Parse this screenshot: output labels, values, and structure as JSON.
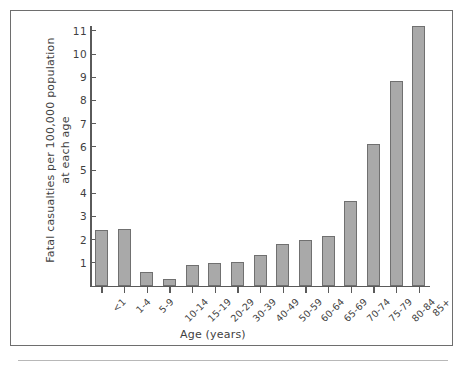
{
  "chart_data": {
    "type": "bar",
    "title": "",
    "subtitle": "",
    "xlabel": "Age (years)",
    "ylabel_line1": "Fatal casualties per 100,000 population",
    "ylabel_line2": "at each age",
    "categories": [
      "<1",
      "1-4",
      "5-9",
      "10-14",
      "15-19",
      "20-29",
      "30-39",
      "40-49",
      "50-59",
      "60-64",
      "65-69",
      "70-74",
      "75-79",
      "80-84",
      "85+"
    ],
    "values": [
      2.4,
      2.45,
      0.62,
      0.3,
      0.9,
      0.97,
      1.03,
      1.35,
      1.8,
      1.97,
      2.15,
      3.65,
      6.1,
      8.85,
      11.2
    ],
    "yticks": [
      1,
      2,
      3,
      4,
      5,
      6,
      7,
      8,
      9,
      10,
      11
    ],
    "ylim": [
      0,
      11.7
    ],
    "grid": false,
    "legend": "none",
    "bar_color": "#a9a9a9",
    "bar_edge_color": "#707070",
    "axis_color": "#5a5a5a"
  }
}
